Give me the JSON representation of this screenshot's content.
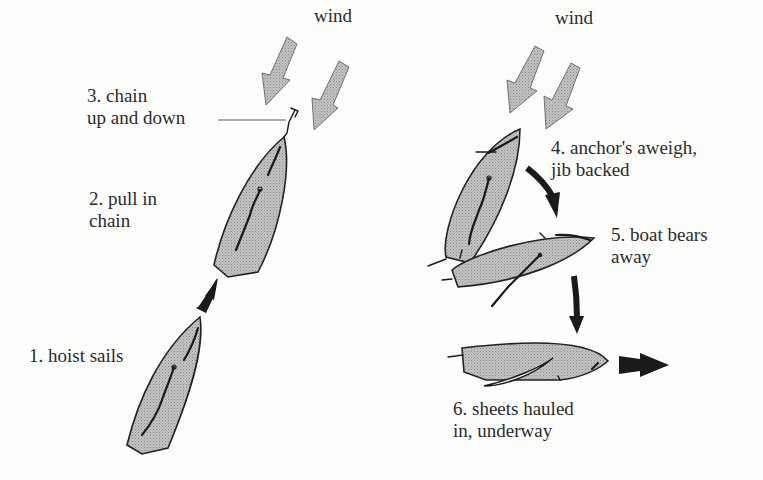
{
  "wind_labels": [
    "wind",
    "wind"
  ],
  "steps": [
    {
      "number": 1,
      "text": "1. hoist sails"
    },
    {
      "number": 2,
      "line1": "2. pull in",
      "line2": "chain"
    },
    {
      "number": 3,
      "line1": "3. chain",
      "line2": "up and down"
    },
    {
      "number": 4,
      "line1": "4. anchor's aweigh,",
      "line2": "jib backed"
    },
    {
      "number": 5,
      "line1": "5. boat bears",
      "line2": "away"
    },
    {
      "number": 6,
      "line1": "6. sheets hauled",
      "line2": "in, underway"
    }
  ],
  "icons": {
    "wind_arrows": "wind-arrow-icon",
    "motion_arrows": "direction-arrow-icon",
    "anchor": "anchor-icon",
    "boats": "sailboat-icon"
  },
  "colors": {
    "hull_fill": "#b8b8b8",
    "wind_arrow_fill": "#b0b0b0",
    "outline": "#222222",
    "text": "#2b2b2b",
    "background": "#fdfdfb"
  }
}
